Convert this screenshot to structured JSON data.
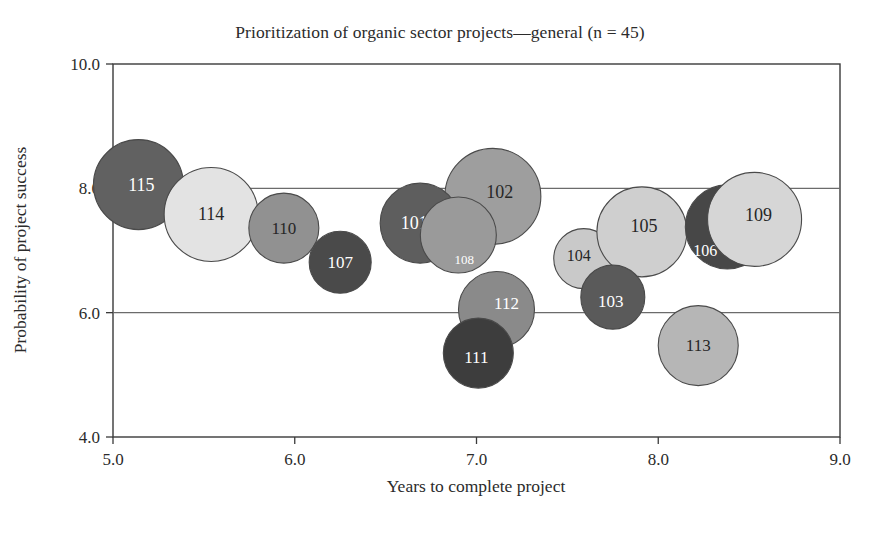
{
  "chart": {
    "title": "Prioritization of organic sector projects—general (n = 45)",
    "xlabel": "Years to complete project",
    "ylabel": "Probability of project success"
  },
  "chart_data": {
    "type": "scatter",
    "title": "Prioritization of organic sector projects—general (n = 45)",
    "xlabel": "Years to complete project",
    "ylabel": "Probability of project success",
    "xlim": [
      5.0,
      9.0
    ],
    "ylim": [
      4.0,
      10.0
    ],
    "xticks": [
      "5.0",
      "6.0",
      "7.0",
      "8.0",
      "9.0"
    ],
    "yticks": [
      "10.0",
      "8.0",
      "6.0",
      "4.0"
    ],
    "grid": "horizontal gridlines at y = 8.0 and y = 6.0",
    "legend": "none",
    "note": "bubble chart; marker area encodes a third variable (project size)",
    "points": [
      {
        "label": "101",
        "x": 6.69,
        "y": 7.44,
        "r_px": 40,
        "fill": "#5e5e5e",
        "text_color": "#ffffff",
        "font_size": 18,
        "z": 5
      },
      {
        "label": "102",
        "x": 7.09,
        "y": 7.87,
        "r_px": 48,
        "fill": "#9e9e9e",
        "text_color": "#262626",
        "font_size": 18,
        "z": 4
      },
      {
        "label": "103",
        "x": 7.75,
        "y": 6.25,
        "r_px": 32,
        "fill": "#5a5a5a",
        "text_color": "#ffffff",
        "font_size": 17,
        "z": 9
      },
      {
        "label": "104",
        "x": 7.59,
        "y": 6.87,
        "r_px": 30,
        "fill": "#c9c9c9",
        "text_color": "#262626",
        "font_size": 16,
        "z": 7
      },
      {
        "label": "105",
        "x": 7.91,
        "y": 7.3,
        "r_px": 45,
        "fill": "#cfcfcf",
        "text_color": "#262626",
        "font_size": 18,
        "z": 8
      },
      {
        "label": "106",
        "x": 8.38,
        "y": 7.38,
        "r_px": 42,
        "fill": "#474747",
        "text_color": "#ffffff",
        "font_size": 16,
        "z": 10
      },
      {
        "label": "107",
        "x": 6.25,
        "y": 6.81,
        "r_px": 31,
        "fill": "#4a4a4a",
        "text_color": "#ffffff",
        "font_size": 17,
        "z": 3
      },
      {
        "label": "108",
        "x": 6.9,
        "y": 7.25,
        "r_px": 38,
        "fill": "#9a9a9a",
        "text_color": "#ffffff",
        "font_size": 13,
        "z": 6
      },
      {
        "label": "109",
        "x": 8.53,
        "y": 7.5,
        "r_px": 47,
        "fill": "#d6d6d6",
        "text_color": "#262626",
        "font_size": 18,
        "z": 11
      },
      {
        "label": "110",
        "x": 5.94,
        "y": 7.36,
        "r_px": 35,
        "fill": "#919191",
        "text_color": "#262626",
        "font_size": 17,
        "z": 2
      },
      {
        "label": "111",
        "x": 7.01,
        "y": 5.35,
        "r_px": 35,
        "fill": "#3d3d3d",
        "text_color": "#ffffff",
        "font_size": 17,
        "z": 13
      },
      {
        "label": "112",
        "x": 7.11,
        "y": 6.05,
        "r_px": 38,
        "fill": "#8a8a8a",
        "text_color": "#ffffff",
        "font_size": 17,
        "z": 12
      },
      {
        "label": "113",
        "x": 8.22,
        "y": 5.47,
        "r_px": 40,
        "fill": "#b6b6b6",
        "text_color": "#262626",
        "font_size": 17,
        "z": 14
      },
      {
        "label": "114",
        "x": 5.54,
        "y": 7.58,
        "r_px": 47,
        "fill": "#e3e3e3",
        "text_color": "#262626",
        "font_size": 18,
        "z": 1
      },
      {
        "label": "115",
        "x": 5.14,
        "y": 8.06,
        "r_px": 45,
        "fill": "#616161",
        "text_color": "#ffffff",
        "font_size": 18,
        "z": 0
      }
    ]
  },
  "colors": {
    "axis": "#3a3a3a",
    "gridline": "#6b6b6b",
    "bubble_stroke": "#4a4a4a",
    "text": "#2b2b2b"
  }
}
